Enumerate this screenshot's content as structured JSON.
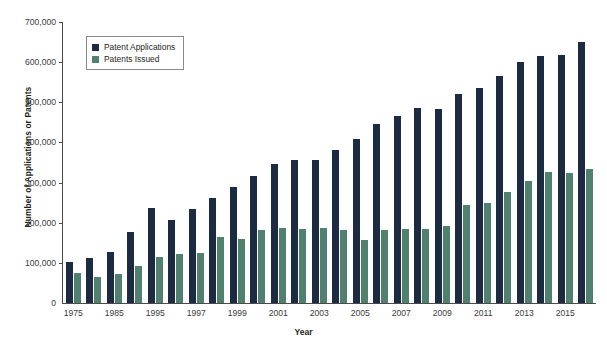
{
  "chart_data": {
    "type": "bar",
    "title": "",
    "subtitle": "",
    "xlabel": "Year",
    "ylabel": "Number of Applications or Patents",
    "ylim": [
      0,
      700000
    ],
    "ytick_step": 100000,
    "ytick_labels": [
      "700,000",
      "600,000",
      "500,000",
      "400,000",
      "300,000",
      "200,000",
      "100,000",
      "0"
    ],
    "ytick_values": [
      700000,
      600000,
      500000,
      400000,
      300000,
      200000,
      100000,
      0
    ],
    "grid": false,
    "legend_position": "upper-left-inside",
    "categories": [
      "1975",
      "1980",
      "1985",
      "1990",
      "1995",
      "1996",
      "1997",
      "1998",
      "1999",
      "2000",
      "2001",
      "2002",
      "2003",
      "2004",
      "2005",
      "2006",
      "2007",
      "2008",
      "2009",
      "2010",
      "2011",
      "2012",
      "2013",
      "2014",
      "2015",
      "2016"
    ],
    "xtick_labels": [
      "1975",
      "1985",
      "1995",
      "1997",
      "1999",
      "2001",
      "2003",
      "2005",
      "2007",
      "2009",
      "2011",
      "2013",
      "2015"
    ],
    "series": [
      {
        "name": "Patent Applications",
        "color": "#1c2b42",
        "values": [
          101000,
          113000,
          127000,
          176000,
          236000,
          207000,
          233000,
          261000,
          289000,
          316000,
          346000,
          357000,
          356000,
          382000,
          409000,
          446000,
          467000,
          486000,
          483000,
          520000,
          536000,
          566000,
          601000,
          616000,
          619000,
          650000
        ]
      },
      {
        "name": "Patents Issued",
        "color": "#50806e",
        "values": [
          76000,
          66000,
          72000,
          91000,
          114000,
          122000,
          124000,
          164000,
          159000,
          183000,
          187000,
          184000,
          187000,
          181000,
          157000,
          183000,
          185000,
          185000,
          192000,
          244000,
          248000,
          277000,
          303000,
          326000,
          325000,
          334000
        ]
      }
    ]
  },
  "legend": {
    "items": [
      {
        "label": "Patent Applications",
        "color": "#1c2b42"
      },
      {
        "label": "Patents Issued",
        "color": "#50806e"
      }
    ]
  }
}
